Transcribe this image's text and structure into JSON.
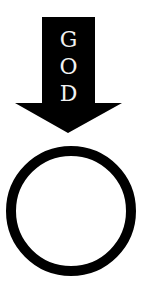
{
  "figure": {
    "arrow": {
      "color": "#000000",
      "direction": "down",
      "letters": [
        "G",
        "O",
        "D"
      ],
      "letter_color": "#f2f2f2"
    },
    "circle": {
      "stroke_color": "#000000",
      "fill": "#ffffff"
    }
  }
}
